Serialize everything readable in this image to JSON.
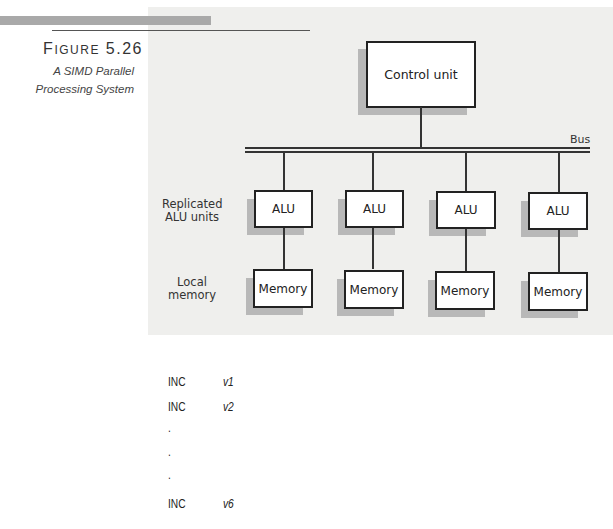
{
  "figure": {
    "number_prefix": "F",
    "number_rest": "IGURE",
    "number_value": "5.26",
    "caption_line1": "A SIMD Parallel",
    "caption_line2": "Processing System"
  },
  "diagram": {
    "control_unit": {
      "label": "Control unit"
    },
    "bus": {
      "label": "Bus"
    },
    "row_labels": {
      "alu_line1": "Replicated",
      "alu_line2": "ALU units",
      "memory_line1": "Local",
      "memory_line2": "memory"
    },
    "alu_units": [
      {
        "label": "ALU"
      },
      {
        "label": "ALU"
      },
      {
        "label": "ALU"
      },
      {
        "label": "ALU"
      }
    ],
    "memory_units": [
      {
        "label": "Memory"
      },
      {
        "label": "Memory"
      },
      {
        "label": "Memory"
      },
      {
        "label": "Memory"
      }
    ]
  },
  "code_listing": {
    "lines": [
      {
        "op": "INC",
        "arg": "v1"
      },
      {
        "op": "INC",
        "arg": "v2"
      },
      {
        "op": ".",
        "arg": ""
      },
      {
        "op": ".",
        "arg": ""
      },
      {
        "op": ".",
        "arg": ""
      },
      {
        "op": "INC",
        "arg": "v6"
      }
    ]
  }
}
